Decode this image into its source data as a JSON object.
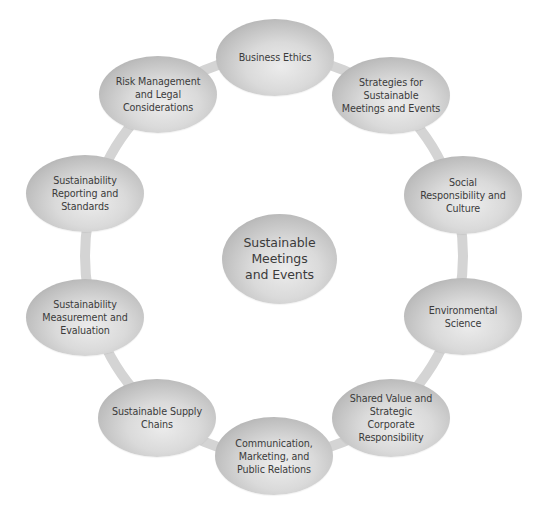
{
  "diagram": {
    "type": "cycle",
    "center": {
      "label": "Sustainable\nMeetings\nand Events"
    },
    "ring_color": "#d4d4d4",
    "node_fill": "#cfcfcf",
    "text_color": "#3b3b3b",
    "nodes": [
      {
        "label": "Business Ethics"
      },
      {
        "label": "Strategies for\nSustainable\nMeetings and Events"
      },
      {
        "label": "Social\nResponsibility and\nCulture"
      },
      {
        "label": "Environmental\nScience"
      },
      {
        "label": "Shared Value and\nStrategic\nCorporate\nResponsibility"
      },
      {
        "label": "Communication,\nMarketing, and\nPublic Relations"
      },
      {
        "label": "Sustainable Supply\nChains"
      },
      {
        "label": "Sustainability\nMeasurement and\nEvaluation"
      },
      {
        "label": "Sustainability\nReporting and\nStandards"
      },
      {
        "label": "Risk Management\nand Legal\nConsiderations"
      }
    ]
  }
}
